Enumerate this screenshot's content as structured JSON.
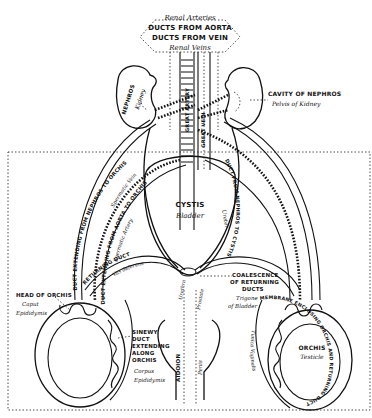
{
  "diagram": {
    "top_labels": {
      "line1": "Renal Arteries",
      "line2": "DUCTS FROM AORTA",
      "line3": "DUCTS FROM VEIN",
      "line4": "Renal Veins"
    },
    "aorta_label": "GREAT ARTERY",
    "vein_label": "GREAT VEIN",
    "kidney_left": {
      "title": "NEPHROS",
      "subtitle": "Kidney"
    },
    "kidney_right_cavity": {
      "title": "CAVITY OF NEPHROS",
      "subtitle": "Pelvis of Kidney"
    },
    "duct_vein": {
      "title": "DUCT EXTENDING FROM NEPHROS TO ORCHIS",
      "subtitle": "Spermatic Vein"
    },
    "duct_artery": {
      "title": "DUCT EXTENDING FROM AORTA TO ORCHIS",
      "subtitle": "Spermatic Artery"
    },
    "ureter": {
      "title": "DUCT FROM NEPHROS TO CYSTIS",
      "subtitle": "Ureter"
    },
    "bladder": {
      "title": "CYSTIS",
      "subtitle": "Bladder"
    },
    "returning_duct": {
      "title": "RETURNING DUCT",
      "subtitle": "Vas deferens"
    },
    "coalescence": {
      "line1": "COALESCENCE",
      "line2": "OF RETURNING",
      "line3": "DUCTS",
      "sub1": "Trigone",
      "sub2": "of Bladder"
    },
    "head_of_orchis": {
      "title": "HEAD OF ORCHIS",
      "sub1": "Caput",
      "sub2": "Epididymis"
    },
    "sinewy_duct": {
      "lines": [
        "SINEWY",
        "DUCT",
        "EXTENDING",
        "ALONG",
        "ORCHIS"
      ],
      "sub1": "Corpus",
      "sub2": "Epididymis"
    },
    "aidoion": {
      "title": "AIDOION",
      "subtitle": "Penis"
    },
    "urethra": "Urethra",
    "prostate": "Prostate",
    "orchis": {
      "title": "ORCHIS",
      "subtitle": "Testicle"
    },
    "membrane": {
      "title": "MEMBRANE ENCLOSING ORCHIS AND RETURNING DUCT",
      "subtitle": "Tunica Vaginalis"
    }
  }
}
